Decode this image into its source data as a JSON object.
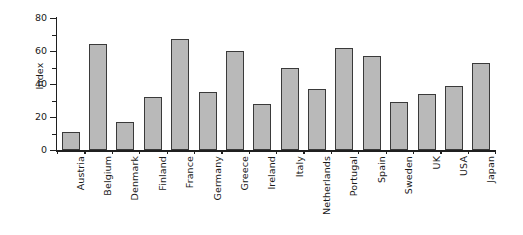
{
  "chart_data": {
    "type": "bar",
    "title": "",
    "xlabel": "",
    "ylabel": "Index",
    "ylim": [
      0,
      80
    ],
    "ytick_labels": [
      "0",
      "20",
      "40",
      "60",
      "80"
    ],
    "ytick_values": [
      0,
      20,
      40,
      60,
      80
    ],
    "yminor_values": [
      10,
      30,
      50,
      70
    ],
    "grid": false,
    "legend": false,
    "categories": [
      "Austria",
      "Belgium",
      "Denmark",
      "Finland",
      "France",
      "Germany",
      "Greece",
      "Ireland",
      "Italy",
      "Netherlands",
      "Portugal",
      "Spain",
      "Sweden",
      "UK",
      "USA",
      "Japan"
    ],
    "values": [
      11,
      64,
      17,
      32,
      67,
      35,
      60,
      28,
      50,
      37,
      62,
      57,
      29,
      34,
      39,
      53
    ],
    "bar_fill_color": "#b9b9b9",
    "bar_edge_color": "#3a3a3a",
    "axis_color": "#1f1f1f",
    "background_color": "#ffffff"
  }
}
